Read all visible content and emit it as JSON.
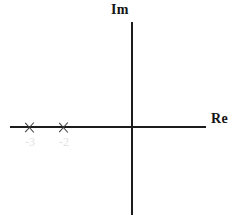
{
  "figure": {
    "width": 238,
    "height": 224,
    "background": "#ffffff",
    "axis_color": "#1c1c1c",
    "marker_color": "#3a3a3a",
    "tick_label_color": "#e2e2e2"
  },
  "axes": {
    "real": {
      "label": "Re",
      "name": "real-axis"
    },
    "imaginary": {
      "label": "Im",
      "name": "imaginary-axis"
    }
  },
  "ticks": [
    {
      "label": "-3",
      "value": -3
    },
    {
      "label": "-2",
      "value": -2
    }
  ],
  "chart_data": {
    "type": "scatter",
    "title": "",
    "subtitle": "",
    "xlabel": "Re",
    "ylabel": "Im",
    "grid": false,
    "legend": null,
    "xlim": [
      -3.8,
      2.2
    ],
    "ylim": [
      -2.7,
      1.5
    ],
    "xticks": [
      -3,
      -2
    ],
    "xticklabels": [
      "-3",
      "-2"
    ],
    "yticks": [],
    "yticklabels": [],
    "annotations": [],
    "series": [
      {
        "name": "poles",
        "marker": "x",
        "color": "#3a3a3a",
        "points": [
          {
            "x": -3,
            "y": 0,
            "label": "-3"
          },
          {
            "x": -2,
            "y": 0,
            "label": "-2"
          }
        ]
      }
    ]
  }
}
